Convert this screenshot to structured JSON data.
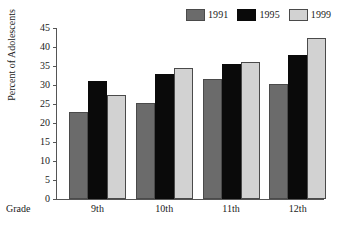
{
  "chart_data": {
    "type": "bar",
    "title": "",
    "xlabel": "Grade",
    "ylabel": "Percent of Adolescents",
    "categories": [
      "9th",
      "10th",
      "11th",
      "12th"
    ],
    "series": [
      {
        "name": "1991",
        "color": "#6b6b6b",
        "values": [
          23.0,
          25.2,
          31.5,
          30.2
        ]
      },
      {
        "name": "1995",
        "color": "#0a0a0a",
        "values": [
          31.0,
          33.0,
          35.5,
          38.0
        ]
      },
      {
        "name": "1999",
        "color": "#d2d2d2",
        "values": [
          27.3,
          34.5,
          36.0,
          42.5
        ]
      }
    ],
    "ylim": [
      0,
      45
    ],
    "yticks": [
      0,
      5,
      10,
      15,
      20,
      25,
      30,
      35,
      40,
      45
    ],
    "ytick_labels": [
      "0",
      "5",
      "10",
      "15",
      "20",
      "25",
      "30",
      "35",
      "40",
      "45"
    ],
    "grid": false,
    "legend_position": "top-right"
  }
}
